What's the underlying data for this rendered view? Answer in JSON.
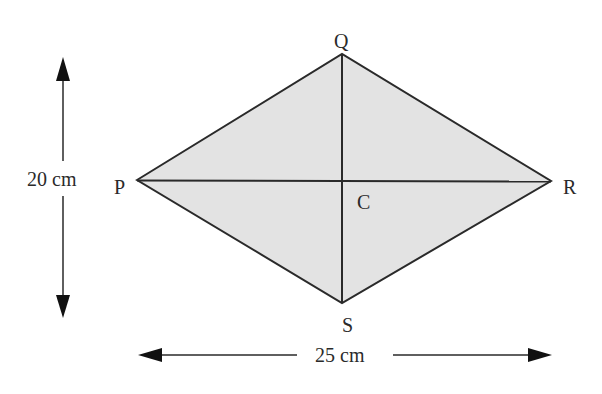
{
  "diagram": {
    "shape": "rhombus",
    "fill_color": "#e3e3e3",
    "stroke_color": "#2a2a2a",
    "vertices": {
      "P": {
        "label": "P",
        "x": 137,
        "y": 180
      },
      "Q": {
        "label": "Q",
        "x": 342,
        "y": 54
      },
      "R": {
        "label": "R",
        "x": 551,
        "y": 181
      },
      "S": {
        "label": "S",
        "x": 342,
        "y": 303
      }
    },
    "center": {
      "label": "C",
      "x": 342,
      "y": 181
    },
    "dimensions": {
      "vertical": {
        "label": "20 cm",
        "value": 20,
        "unit": "cm"
      },
      "horizontal": {
        "label": "25 cm",
        "value": 25,
        "unit": "cm"
      }
    }
  }
}
